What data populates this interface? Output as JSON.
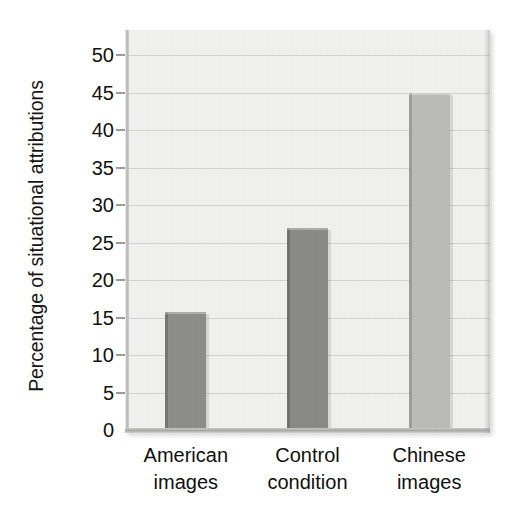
{
  "chart_data": {
    "type": "bar",
    "title": "",
    "subtitle": "",
    "xlabel": "",
    "ylabel": "Percentage of situational attributions",
    "categories": [
      "American images",
      "Control condition",
      "Chinese images"
    ],
    "category_lines": [
      [
        "American",
        "images"
      ],
      [
        "Control",
        "condition"
      ],
      [
        "Chinese",
        "images"
      ]
    ],
    "values": [
      15.7,
      27,
      45
    ],
    "ylim": [
      0,
      50
    ],
    "ytick_values": [
      0,
      5,
      10,
      15,
      20,
      25,
      30,
      35,
      40,
      45,
      50
    ],
    "ytick_labels": [
      "0",
      "5",
      "10",
      "15",
      "20",
      "25",
      "30",
      "35",
      "40",
      "45",
      "50"
    ],
    "grid": true,
    "grid_axis": "y",
    "legend": "none",
    "bar_colors": [
      "#8d8d8b",
      "#8a8a88",
      "#bcbcba"
    ],
    "plot_background": "#f1f1ef",
    "page_background": "#ffffff",
    "gridline_color": "#d2d2d0",
    "axis_color": "#a9a9a7",
    "text_color": "#111111"
  },
  "axis": {
    "y_title": "Percentage of situational attributions"
  }
}
